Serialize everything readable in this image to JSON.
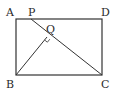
{
  "diagram": {
    "type": "geometry",
    "shape": "rectangle ABCD with segment PC and perpendicular BQ",
    "colors": {
      "stroke": "#333333",
      "background": "#ffffff"
    },
    "points": {
      "A": {
        "label": "A",
        "x": 16,
        "y": 19
      },
      "D": {
        "label": "D",
        "x": 102,
        "y": 19
      },
      "B": {
        "label": "B",
        "x": 16,
        "y": 75
      },
      "C": {
        "label": "C",
        "x": 102,
        "y": 75
      },
      "P": {
        "label": "P",
        "x": 31,
        "y": 19
      },
      "Q": {
        "label": "Q",
        "x": 47,
        "y": 37
      }
    },
    "segments": [
      "AD",
      "DC",
      "CB",
      "BA",
      "PC",
      "BQ"
    ],
    "annotations": [
      "right angle at Q (BQ ⊥ PC)"
    ]
  }
}
